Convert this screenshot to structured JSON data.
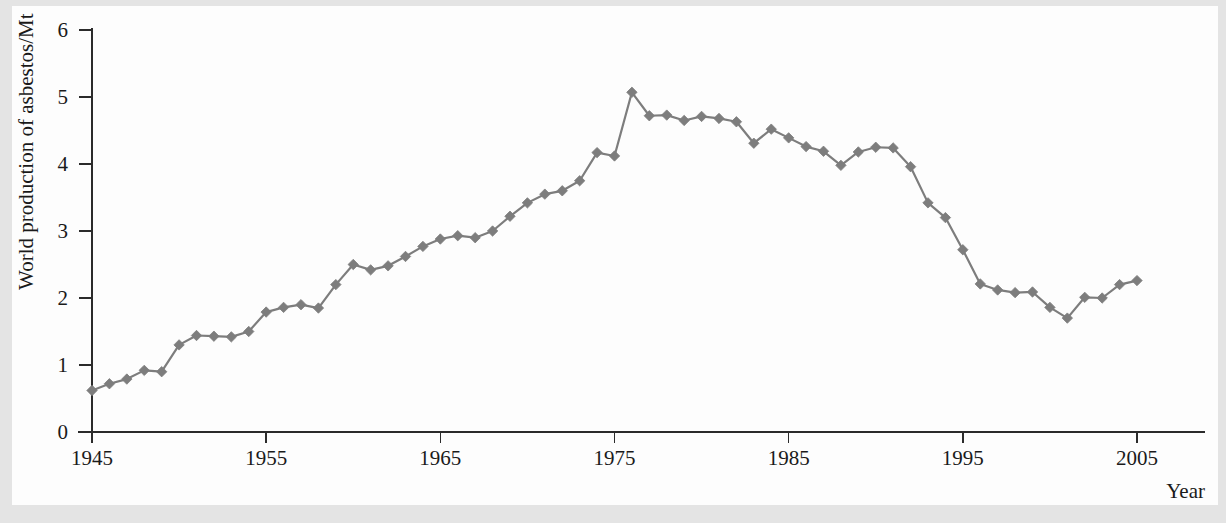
{
  "figure": {
    "background_color": "#e4e4e4",
    "paper_color": "#fdfdfd",
    "series_color": "#7d7d7d",
    "axis_color": "#2b2b2b"
  },
  "chart_data": {
    "type": "line",
    "title": "",
    "subtitle": "",
    "xlabel": "Year",
    "ylabel": "World production of asbestos/Mt",
    "xlim": [
      1945,
      2005
    ],
    "ylim": [
      0,
      6
    ],
    "xticks": [
      1945,
      1955,
      1965,
      1975,
      1985,
      1995,
      2005
    ],
    "xticklabels": [
      "1945",
      "1955",
      "1965",
      "1975",
      "1985",
      "1995",
      "2005"
    ],
    "yticks": [
      0,
      1,
      2,
      3,
      4,
      5,
      6
    ],
    "yticklabels": [
      "0",
      "1",
      "2",
      "3",
      "4",
      "5",
      "6"
    ],
    "grid": false,
    "legend": false,
    "marker": "diamond",
    "x": [
      1945,
      1946,
      1947,
      1948,
      1949,
      1950,
      1951,
      1952,
      1953,
      1954,
      1955,
      1956,
      1957,
      1958,
      1959,
      1960,
      1961,
      1962,
      1963,
      1964,
      1965,
      1966,
      1967,
      1968,
      1969,
      1970,
      1971,
      1972,
      1973,
      1974,
      1975,
      1976,
      1977,
      1978,
      1979,
      1980,
      1981,
      1982,
      1983,
      1984,
      1985,
      1986,
      1987,
      1988,
      1989,
      1990,
      1991,
      1992,
      1993,
      1994,
      1995,
      1996,
      1997,
      1998,
      1999,
      2000,
      2001,
      2002,
      2003,
      2004,
      2005
    ],
    "y": [
      0.62,
      0.72,
      0.79,
      0.92,
      0.9,
      1.3,
      1.44,
      1.43,
      1.42,
      1.5,
      1.79,
      1.86,
      1.9,
      1.85,
      2.2,
      2.5,
      2.42,
      2.48,
      2.62,
      2.77,
      2.88,
      2.93,
      2.9,
      3.0,
      3.22,
      3.42,
      3.55,
      3.6,
      3.75,
      4.17,
      4.12,
      5.07,
      4.72,
      4.73,
      4.65,
      4.71,
      4.68,
      4.63,
      4.31,
      4.52,
      4.39,
      4.26,
      4.19,
      3.98,
      4.18,
      4.25,
      4.24,
      3.96,
      3.42,
      3.2,
      2.72,
      2.21,
      2.12,
      2.08,
      2.09,
      1.86,
      1.7,
      2.01,
      2.0,
      2.2,
      2.26,
      2.27,
      2.33
    ],
    "series": [
      {
        "name": "World production of asbestos",
        "color": "#7d7d7d",
        "marker": "diamond"
      }
    ],
    "annotations": []
  }
}
